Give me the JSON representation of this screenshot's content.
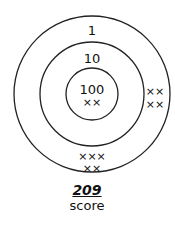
{
  "target": {
    "rings": [
      {
        "label": "1",
        "points": 1
      },
      {
        "label": "10",
        "points": 10
      },
      {
        "label": "100",
        "points": 100
      }
    ],
    "hits": {
      "inner": [
        "××"
      ],
      "middle_right": [
        "××",
        "××"
      ],
      "outer_bottom": [
        "×××",
        "××"
      ]
    }
  },
  "score": {
    "value": "209",
    "label": "score"
  }
}
